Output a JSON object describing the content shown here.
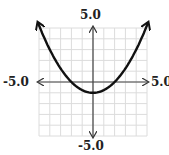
{
  "chart_data": {
    "type": "line",
    "title": "",
    "function": "y = x^2/4 - 1",
    "x": [
      -5,
      -4,
      -3,
      -2,
      -1,
      0,
      1,
      2,
      3,
      4,
      5
    ],
    "series": [
      {
        "name": "parabola",
        "values": [
          5.25,
          3,
          1.25,
          0,
          -0.75,
          -1,
          -0.75,
          0,
          1.25,
          3,
          5.25
        ]
      }
    ],
    "xlim": [
      -5,
      5
    ],
    "ylim": [
      -5,
      5
    ],
    "grid": true,
    "tick_labels": {
      "x_min": "-5.0",
      "x_max": "5.0",
      "y_max": "5.0",
      "y_min": "-5.0"
    }
  },
  "labels": {
    "top": "5.0",
    "bottom": "-5.0",
    "left": "-5.0",
    "right": "5.0"
  }
}
